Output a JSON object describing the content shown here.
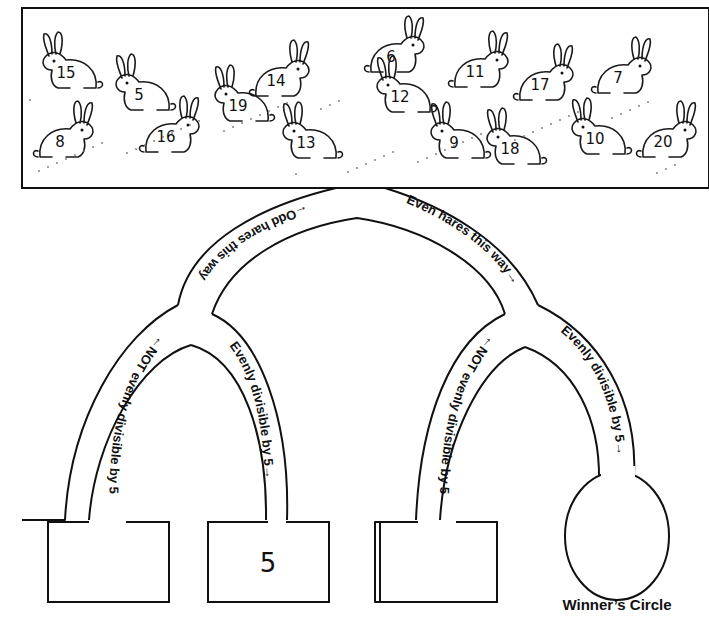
{
  "hares": [
    {
      "number": "15",
      "x": 68,
      "y": 70
    },
    {
      "number": "8",
      "x": 62,
      "y": 139
    },
    {
      "number": "5",
      "x": 141,
      "y": 92
    },
    {
      "number": "16",
      "x": 168,
      "y": 134
    },
    {
      "number": "19",
      "x": 240,
      "y": 103
    },
    {
      "number": "14",
      "x": 278,
      "y": 78
    },
    {
      "number": "13",
      "x": 308,
      "y": 140
    },
    {
      "number": "6",
      "x": 393,
      "y": 54
    },
    {
      "number": "12",
      "x": 402,
      "y": 94
    },
    {
      "number": "11",
      "x": 477,
      "y": 69
    },
    {
      "number": "9",
      "x": 456,
      "y": 140
    },
    {
      "number": "17",
      "x": 542,
      "y": 82
    },
    {
      "number": "18",
      "x": 512,
      "y": 146
    },
    {
      "number": "7",
      "x": 620,
      "y": 75
    },
    {
      "number": "10",
      "x": 597,
      "y": 136
    },
    {
      "number": "20",
      "x": 665,
      "y": 139
    }
  ],
  "paths": {
    "odd": "←Odd hares this way",
    "even": "Even hares this way→",
    "odd_not_div5": "←NOT evenly divisible by 5",
    "odd_div5": "Evenly divisible by 5→",
    "even_not_div5": "←NOT evenly divisible by 5",
    "even_div5": "Evenly divisible by 5→"
  },
  "boxes": [
    {
      "id": "odd-not-div5",
      "value": ""
    },
    {
      "id": "odd-div5",
      "value": "5"
    },
    {
      "id": "even-not-div5",
      "value": ""
    }
  ],
  "winners_circle": {
    "label": "Winner’s Circle",
    "value": ""
  }
}
